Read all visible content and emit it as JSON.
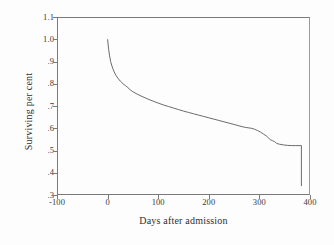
{
  "chart_data": {
    "type": "line",
    "title": "",
    "xlabel": "Days after admission",
    "ylabel": "Surviving per cent",
    "xlim": [
      -100,
      400
    ],
    "ylim": [
      0.3,
      1.1
    ],
    "xticks": [
      -100,
      0,
      100,
      200,
      300,
      400
    ],
    "xtick_labels": [
      "-100",
      "0",
      "100",
      "200",
      "300",
      "400"
    ],
    "yticks": [
      0.3,
      0.4,
      0.5,
      0.6,
      0.7,
      0.8,
      0.9,
      1.0,
      1.1
    ],
    "ytick_labels": [
      ".3",
      ".4",
      ".5",
      ".6",
      ".7",
      ".8",
      ".9",
      "1.0",
      "1.1"
    ],
    "grid": false,
    "legend": null,
    "series": [
      {
        "name": "Survival",
        "line_color": "#6b6b6b",
        "line_width": 1,
        "x": [
          0,
          2,
          4,
          6,
          8,
          10,
          13,
          16,
          20,
          25,
          30,
          35,
          40,
          45,
          50,
          58,
          66,
          74,
          82,
          90,
          100,
          110,
          120,
          130,
          140,
          150,
          160,
          170,
          180,
          190,
          200,
          210,
          220,
          230,
          240,
          250,
          258,
          266,
          272,
          278,
          284,
          290,
          296,
          302,
          308,
          314,
          318,
          322,
          326,
          330,
          334,
          340,
          348,
          356,
          364,
          372,
          380,
          383,
          383
        ],
        "y": [
          1.0,
          0.955,
          0.925,
          0.9,
          0.884,
          0.87,
          0.853,
          0.84,
          0.826,
          0.812,
          0.801,
          0.792,
          0.783,
          0.772,
          0.764,
          0.754,
          0.745,
          0.737,
          0.729,
          0.722,
          0.713,
          0.705,
          0.698,
          0.691,
          0.684,
          0.677,
          0.671,
          0.665,
          0.659,
          0.653,
          0.647,
          0.641,
          0.635,
          0.629,
          0.623,
          0.617,
          0.612,
          0.607,
          0.604,
          0.602,
          0.6,
          0.596,
          0.59,
          0.583,
          0.574,
          0.565,
          0.556,
          0.548,
          0.544,
          0.54,
          0.532,
          0.528,
          0.525,
          0.523,
          0.522,
          0.522,
          0.522,
          0.522,
          0.34
        ]
      }
    ]
  }
}
